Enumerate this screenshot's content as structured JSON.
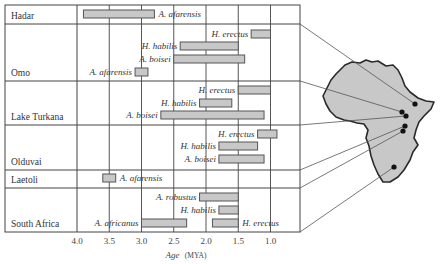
{
  "chart_data": {
    "type": "range-bar",
    "title": "",
    "xlabel": "Age (MYA)",
    "xlabel_italic": "Age",
    "xlabel_unit": "(MYA)",
    "x_reversed": true,
    "xlim": [
      4.0,
      0.5
    ],
    "x_ticks": [
      4.0,
      3.5,
      3.0,
      2.5,
      2.0,
      1.5,
      1.0
    ],
    "x_tick_labels": [
      "4.0",
      "3.5",
      "3.0",
      "2.5",
      "2.0",
      "1.5",
      "1.0"
    ],
    "grid": "vertical",
    "bar_color": "#c8c8c8",
    "bar_edge_color": "#555555",
    "sites": [
      {
        "name": "Hadar",
        "species": [
          {
            "name": "A. afarensis",
            "start": 3.9,
            "end": 2.8,
            "label_side": "right"
          }
        ]
      },
      {
        "name": "Omo",
        "species": [
          {
            "name": "H. erectus",
            "start": 1.3,
            "end": 1.0,
            "label_side": "left"
          },
          {
            "name": "H. habilis",
            "start": 2.4,
            "end": 1.5,
            "label_side": "left"
          },
          {
            "name": "A. boisei",
            "start": 2.5,
            "end": 1.4,
            "label_side": "left"
          },
          {
            "name": "A. afarensis",
            "start": 3.1,
            "end": 2.9,
            "label_side": "left"
          }
        ]
      },
      {
        "name": "Lake Turkana",
        "species": [
          {
            "name": "H. erectus",
            "start": 1.5,
            "end": 1.0,
            "label_side": "left"
          },
          {
            "name": "H. habilis",
            "start": 2.1,
            "end": 1.6,
            "label_side": "left"
          },
          {
            "name": "A. boisei",
            "start": 2.7,
            "end": 1.1,
            "label_side": "left"
          }
        ]
      },
      {
        "name": "Olduvai",
        "species": [
          {
            "name": "H. erectus",
            "start": 1.2,
            "end": 0.9,
            "label_side": "left"
          },
          {
            "name": "H. habilis",
            "start": 1.8,
            "end": 1.2,
            "label_side": "left"
          },
          {
            "name": "A. boisei",
            "start": 1.8,
            "end": 1.1,
            "label_side": "left"
          }
        ]
      },
      {
        "name": "Laetoli",
        "species": [
          {
            "name": "A. afarensis",
            "start": 3.6,
            "end": 3.4,
            "label_side": "right"
          }
        ]
      },
      {
        "name": "South Africa",
        "species": [
          {
            "name": "A. robustus",
            "start": 2.1,
            "end": 1.5,
            "label_side": "left"
          },
          {
            "name": "H. habilis",
            "start": 1.8,
            "end": 1.5,
            "label_side": "left"
          },
          {
            "name": "A. africanus",
            "start": 3.0,
            "end": 2.3,
            "label_side": "left"
          },
          {
            "name": "H. erectus",
            "start": 1.9,
            "end": 1.5,
            "label_side": "right"
          }
        ]
      }
    ],
    "inset_map": {
      "region": "Africa",
      "fill": "#c8c8c8",
      "outline": "#2a2a2a",
      "site_markers": 6
    }
  }
}
